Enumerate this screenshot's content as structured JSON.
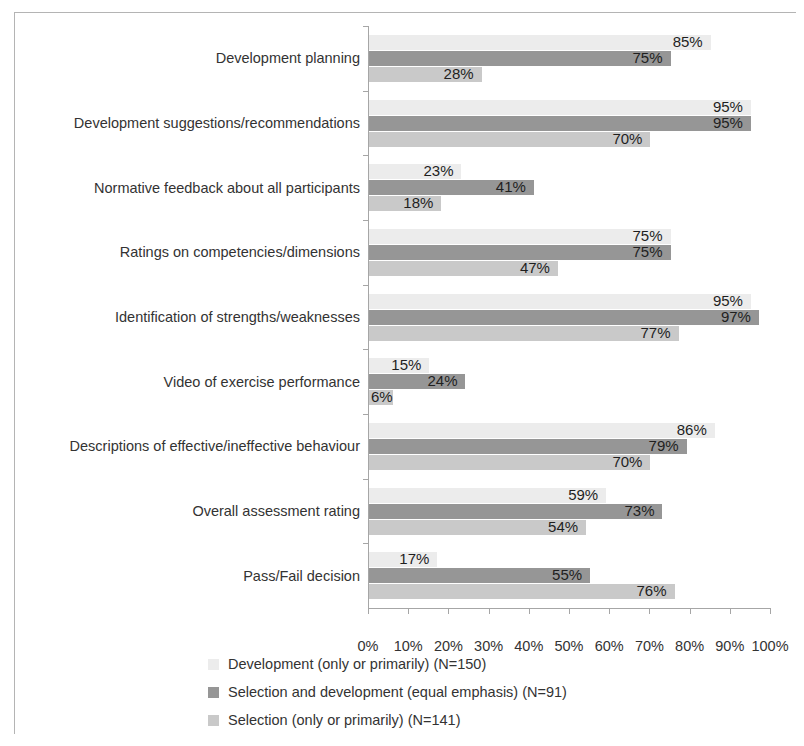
{
  "chart_data": {
    "type": "bar",
    "orientation": "horizontal",
    "title": "",
    "subtitle": "",
    "xlabel": "",
    "ylabel": "",
    "xlim": [
      0,
      100
    ],
    "xtick_labels": [
      "0%",
      "10%",
      "20%",
      "30%",
      "40%",
      "50%",
      "60%",
      "70%",
      "80%",
      "90%",
      "100%"
    ],
    "xtick_values": [
      0,
      10,
      20,
      30,
      40,
      50,
      60,
      70,
      80,
      90,
      100
    ],
    "grid": false,
    "legend_position": "bottom",
    "value_label_suffix": "%",
    "categories": [
      "Development planning",
      "Development suggestions/recommendations",
      "Normative feedback about all participants",
      "Ratings on competencies/dimensions",
      "Identification of strengths/weaknesses",
      "Video of exercise performance",
      "Descriptions of effective/ineffective behaviour",
      "Overall assessment rating",
      "Pass/Fail decision"
    ],
    "series": [
      {
        "name": "Development (only or primarily) (N=150)",
        "color": "#ececec",
        "values": [
          85,
          95,
          23,
          75,
          95,
          15,
          86,
          59,
          17
        ],
        "labels": [
          "85%",
          "95%",
          "23%",
          "75%",
          "95%",
          "15%",
          "86%",
          "59%",
          "17%"
        ]
      },
      {
        "name": "Selection and development (equal emphasis) (N=91)",
        "color": "#969696",
        "values": [
          75,
          95,
          41,
          75,
          97,
          24,
          79,
          73,
          55
        ],
        "labels": [
          "75%",
          "95%",
          "41%",
          "75%",
          "97%",
          "24%",
          "79%",
          "73%",
          "55%"
        ]
      },
      {
        "name": "Selection (only or primarily) (N=141)",
        "color": "#c9c9c9",
        "values": [
          28,
          70,
          18,
          47,
          77,
          6,
          70,
          54,
          76
        ],
        "labels": [
          "28%",
          "70%",
          "18%",
          "47%",
          "77%",
          "6%",
          "70%",
          "54%",
          "76%"
        ]
      }
    ]
  }
}
